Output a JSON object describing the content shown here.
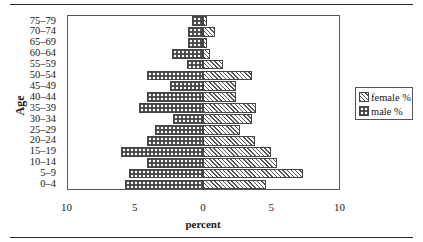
{
  "chart_data": {
    "type": "bar",
    "orientation": "horizontal",
    "subtype": "population-pyramid",
    "title": "",
    "xlabel": "percent",
    "ylabel": "Age",
    "xlim": [
      -10,
      10
    ],
    "x_ticks": [
      "10",
      "5",
      "0",
      "5",
      "10"
    ],
    "grid": false,
    "legend_position": "right",
    "categories": [
      "75–79",
      "70–74",
      "65–69",
      "60–64",
      "55–59",
      "50–54",
      "45–49",
      "40–44",
      "35–39",
      "30–34",
      "25–29",
      "20–24",
      "15–19",
      "10–14",
      "5–9",
      "0–4"
    ],
    "series": [
      {
        "name": "female %",
        "side": "right",
        "pattern": "diagonal-hatch",
        "values": [
          0.3,
          0.9,
          0.3,
          0.5,
          1.5,
          3.6,
          2.4,
          2.4,
          3.9,
          3.6,
          2.7,
          3.8,
          5.0,
          5.4,
          7.3,
          4.6
        ]
      },
      {
        "name": "male %",
        "side": "left",
        "pattern": "crosshatch",
        "values": [
          0.8,
          1.1,
          1.1,
          2.3,
          1.2,
          4.1,
          2.4,
          4.1,
          4.7,
          2.2,
          3.5,
          4.1,
          6.0,
          4.1,
          5.4,
          5.7
        ]
      }
    ]
  },
  "legend": {
    "female_label": "female %",
    "male_label": "male %"
  },
  "axes": {
    "y_title": "Age",
    "x_title": "percent"
  }
}
